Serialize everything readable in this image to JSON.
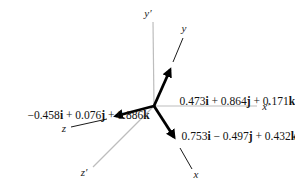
{
  "figure": {
    "background": "#ffffff",
    "primed_axis_color": "#bdbdbd",
    "vector_color": "#000000"
  },
  "axes": {
    "x_prime": "x′",
    "y_prime": "y′",
    "z_prime": "z′",
    "x": "x",
    "y": "y",
    "z": "z"
  },
  "vector_labels": {
    "y_vector": {
      "c1": "0.473",
      "u1": "i",
      "c2": " + 0.864",
      "u2": "j",
      "c3": " + 0.171",
      "u3": "k"
    },
    "x_vector": {
      "c1": "0.753",
      "u1": "i",
      "c2": " − 0.497",
      "u2": "j",
      "c3": " + 0.432",
      "u3": "k"
    },
    "z_vector": {
      "c1": "−0.458",
      "u1": "i",
      "c2": " + 0.076",
      "u2": "j",
      "c3": " + 0.886",
      "u3": "k"
    }
  }
}
